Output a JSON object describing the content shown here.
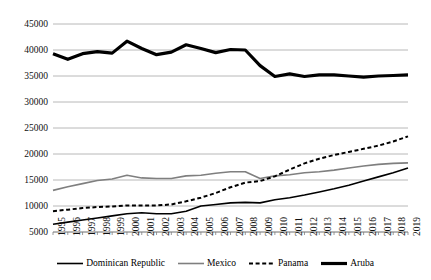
{
  "chart_data": {
    "type": "line",
    "title": "",
    "xlabel": "",
    "ylabel": "",
    "ylim": [
      5000,
      45000
    ],
    "ytick_step": 5000,
    "grid": true,
    "legend_position": "bottom",
    "yticks": [
      "45000",
      "40000",
      "35000",
      "30000",
      "25000",
      "20000",
      "15000",
      "10000",
      "5000"
    ],
    "ytick_values": [
      45000,
      40000,
      35000,
      30000,
      25000,
      20000,
      15000,
      10000,
      5000
    ],
    "categories": [
      "1995",
      "1996",
      "1997",
      "1998",
      "1999",
      "2000",
      "2001",
      "2002",
      "2003",
      "2004",
      "2005",
      "2006",
      "2007",
      "2008",
      "2009",
      "2010",
      "2011",
      "2012",
      "2013",
      "2014",
      "2015",
      "2016",
      "2017",
      "2018",
      "2019"
    ],
    "series": [
      {
        "name": "Dominican Republic",
        "style": "solid-thin",
        "color": "#000000",
        "values": [
          6500,
          6900,
          7300,
          7700,
          8100,
          8500,
          8700,
          8500,
          8500,
          9000,
          10000,
          10300,
          10600,
          10700,
          10600,
          11200,
          11600,
          12100,
          12700,
          13300,
          14000,
          14800,
          15600,
          16400,
          17300
        ]
      },
      {
        "name": "Mexico",
        "style": "solid-gray",
        "color": "#7f7f7f",
        "values": [
          13000,
          13700,
          14300,
          14900,
          15200,
          15900,
          15400,
          15300,
          15300,
          15800,
          15900,
          16300,
          16600,
          16600,
          15300,
          15800,
          16000,
          16400,
          16600,
          16900,
          17300,
          17700,
          18000,
          18200,
          18300
        ]
      },
      {
        "name": "Panama",
        "style": "dashed",
        "color": "#000000",
        "values": [
          9000,
          9300,
          9600,
          9800,
          9900,
          10100,
          10100,
          10100,
          10300,
          10900,
          11600,
          12500,
          13600,
          14500,
          14800,
          15700,
          17000,
          18200,
          19100,
          19800,
          20400,
          21000,
          21600,
          22400,
          23400
        ]
      },
      {
        "name": "Aruba",
        "style": "solid-thick",
        "color": "#000000",
        "values": [
          39300,
          38200,
          39300,
          39700,
          39400,
          41700,
          40300,
          39100,
          39600,
          41000,
          40300,
          39500,
          40100,
          40000,
          37000,
          34900,
          35400,
          34900,
          35200,
          35200,
          35000,
          34800,
          35000,
          35100,
          35200
        ]
      }
    ]
  },
  "legend": {
    "items": [
      {
        "label": "Dominican Republic",
        "swatch": "solid-thin"
      },
      {
        "label": "Mexico",
        "swatch": "solid-gray"
      },
      {
        "label": "Panama",
        "swatch": "dashed"
      },
      {
        "label": "Aruba",
        "swatch": "solid-thick"
      }
    ]
  }
}
